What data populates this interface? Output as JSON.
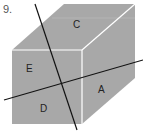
{
  "problem_number": "9.",
  "diagram": {
    "shape": "rectangular box",
    "face_color": "#a8a8a8",
    "edge_color": "#ffffff",
    "line_color": "#111111",
    "labels": {
      "top": "C",
      "front_upper": "E",
      "front_lower": "D",
      "right": "A"
    }
  }
}
